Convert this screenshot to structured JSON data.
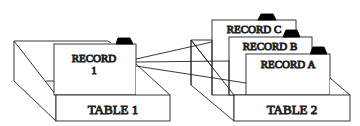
{
  "diagram": {
    "type": "relational-tables-illustration",
    "colors": {
      "stroke": "#222222",
      "fill": "#ffffff",
      "tab": "#000000"
    },
    "tables": [
      {
        "label": "TABLE 1",
        "records": [
          {
            "line1": "RECORD",
            "line2": "1"
          }
        ]
      },
      {
        "label": "TABLE 2",
        "records": [
          {
            "line1": "RECORD C"
          },
          {
            "line1": "RECORD B"
          },
          {
            "line1": "RECORD A"
          }
        ]
      }
    ],
    "relationships": [
      {
        "from": "RECORD 1",
        "to": "RECORD C"
      },
      {
        "from": "RECORD 1",
        "to": "RECORD B"
      },
      {
        "from": "RECORD 1",
        "to": "RECORD A"
      }
    ]
  }
}
